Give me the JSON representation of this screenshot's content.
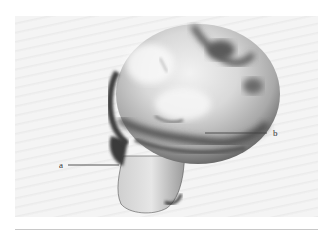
{
  "figure": {
    "labels": [
      {
        "id": "a",
        "text": "a",
        "target": "femoral neck (left lower edge)"
      },
      {
        "id": "b",
        "text": "b",
        "target": "region on the femoral head (right)"
      }
    ],
    "colors": {
      "background": "#f1f1f1",
      "leader_line": "#444444",
      "rule": "#c8c8c8"
    }
  }
}
